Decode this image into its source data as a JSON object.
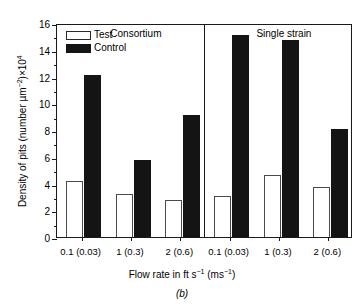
{
  "chart_data": {
    "type": "bar",
    "title": "",
    "caption": "(b)",
    "xlabel_html": "Flow rate in ft s<sup>−1</sup> (ms<sup>−1</sup>)",
    "ylabel_html": "Density of pits (number µm<sup>−2</sup>)×10<sup>4</sup>",
    "ylim": [
      0,
      16
    ],
    "ytick_labels": [
      "0",
      "2",
      "4",
      "6",
      "8",
      "10",
      "12",
      "14",
      "16"
    ],
    "ytick_values": [
      0,
      2,
      4,
      6,
      8,
      10,
      12,
      14,
      16
    ],
    "yminor_values": [
      1,
      3,
      5,
      7,
      9,
      11,
      13,
      15
    ],
    "grid": false,
    "legend_position": "top-left",
    "categories": [
      "0.1 (0.03)",
      "1 (0.3)",
      "2 (0.6)",
      "0.1 (0.03)",
      "1 (0.3)",
      "2 (0.6)"
    ],
    "groups": [
      {
        "label": "Consortium",
        "categories": [
          "0.1 (0.03)",
          "1 (0.3)",
          "2 (0.6)"
        ]
      },
      {
        "label": "Single strain",
        "categories": [
          "0.1 (0.03)",
          "1 (0.3)",
          "2 (0.6)"
        ]
      }
    ],
    "series": [
      {
        "name": "Test",
        "color": "#ffffff",
        "edge_color": "#4a4a4a",
        "values": [
          4.2,
          3.2,
          2.75,
          3.1,
          4.6,
          3.75
        ]
      },
      {
        "name": "Control",
        "color": "#141414",
        "edge_color": "#141414",
        "values": [
          12.1,
          5.75,
          9.1,
          15.1,
          14.75,
          8.1
        ]
      }
    ]
  },
  "legend": {
    "items": [
      {
        "label": "Test"
      },
      {
        "label": "Control"
      }
    ]
  }
}
